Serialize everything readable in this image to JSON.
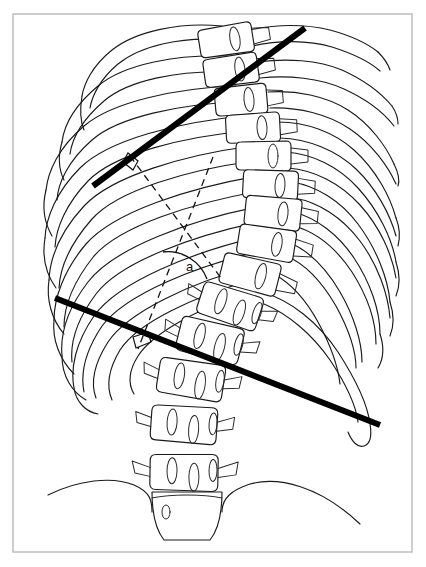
{
  "figure": {
    "angle_label": "a",
    "frame": {
      "x": 13,
      "y": 14,
      "width": 399,
      "height": 538,
      "color": "#b9b9b9"
    },
    "colors": {
      "cobb_line": "#000000",
      "perpendicular_line": "#111111",
      "anatomy_outline": "#1a1a1a",
      "background": "#ffffff",
      "frame": "#b9b9b9"
    }
  },
  "measurement": {
    "type": "cobb-angle",
    "angle_symbol": "a",
    "upper_endplate_line": {
      "name": "superior-end-vertebra-endplate-line",
      "x1": 93,
      "y1": 186,
      "x2": 305,
      "y2": 28,
      "stroke_width": 6
    },
    "lower_endplate_line": {
      "name": "inferior-end-vertebra-endplate-line",
      "x1": 55,
      "y1": 298,
      "x2": 380,
      "y2": 425,
      "stroke_width": 6
    },
    "upper_perpendicular": {
      "name": "perpendicular-to-upper-endplate",
      "x1": 130,
      "y1": 156,
      "x2": 221,
      "y2": 278,
      "dash": "7 5"
    },
    "lower_perpendicular": {
      "name": "perpendicular-to-lower-endplate",
      "x1": 213,
      "y1": 157,
      "x2": 138,
      "y2": 349,
      "dash": "7 5"
    },
    "intersection": {
      "x": 183,
      "y": 247
    },
    "arc": {
      "center_x": 183,
      "center_y": 247,
      "radius": 40,
      "start_deg": 53,
      "end_deg": 111
    },
    "label_position": {
      "x": 186,
      "y": 271
    }
  },
  "anatomy": {
    "regions": [
      {
        "name": "thoracic-rib-cage-left",
        "count": 11
      },
      {
        "name": "thoracic-rib-cage-right",
        "count": 11
      },
      {
        "name": "thoracic-vertebrae",
        "count": 9
      },
      {
        "name": "lumbar-vertebrae",
        "count": 5
      },
      {
        "name": "iliac-crest-left"
      },
      {
        "name": "iliac-crest-right"
      },
      {
        "name": "sacrum"
      }
    ],
    "thoracic_vertebrae": [
      {
        "id": "T1",
        "cx": 228,
        "cy": 40,
        "w": 44,
        "h": 26,
        "rot": -9
      },
      {
        "id": "T2",
        "cx": 233,
        "cy": 70,
        "w": 44,
        "h": 26,
        "rot": -8
      },
      {
        "id": "T3",
        "cx": 243,
        "cy": 100,
        "w": 43,
        "h": 26,
        "rot": -5
      },
      {
        "id": "T4",
        "cx": 255,
        "cy": 128,
        "w": 44,
        "h": 26,
        "rot": -3
      },
      {
        "id": "T5",
        "cx": 265,
        "cy": 156,
        "w": 45,
        "h": 27,
        "rot": 0
      },
      {
        "id": "T6",
        "cx": 272,
        "cy": 185,
        "w": 45,
        "h": 27,
        "rot": 2
      },
      {
        "id": "T7",
        "cx": 275,
        "cy": 213,
        "w": 46,
        "h": 28,
        "rot": 5
      },
      {
        "id": "T8",
        "cx": 268,
        "cy": 243,
        "w": 47,
        "h": 28,
        "rot": 8
      },
      {
        "id": "T9",
        "cx": 252,
        "cy": 274,
        "w": 48,
        "h": 29,
        "rot": 13
      }
    ],
    "lumbar_vertebrae": [
      {
        "id": "L1",
        "cx": 232,
        "cy": 306,
        "w": 52,
        "h": 31,
        "rot": 17
      },
      {
        "id": "L2",
        "cx": 212,
        "cy": 340,
        "w": 54,
        "h": 33,
        "rot": 14
      },
      {
        "id": "L3",
        "cx": 193,
        "cy": 379,
        "w": 56,
        "h": 34,
        "rot": 9
      },
      {
        "id": "L4",
        "cx": 186,
        "cy": 424,
        "w": 56,
        "h": 34,
        "rot": 4
      },
      {
        "id": "L5",
        "cx": 186,
        "cy": 472,
        "w": 57,
        "h": 34,
        "rot": 1
      }
    ]
  }
}
